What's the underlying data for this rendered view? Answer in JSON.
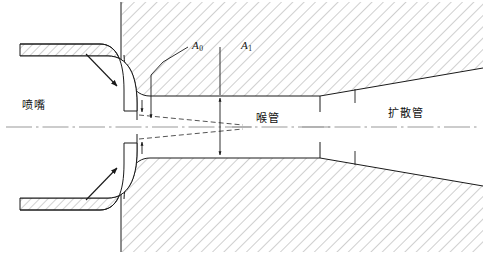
{
  "figure": {
    "kind": "engineering-cross-section",
    "background_color": "#ffffff",
    "line_color": "#1a1a1a",
    "hatch_color": "#8c8c8c",
    "centerline_color": "#999999",
    "dash_color": "#555555"
  },
  "labels": {
    "nozzle": "喷嘴",
    "throat": "喉管",
    "diffuser": "扩散管",
    "area_nozzle": "A",
    "area_nozzle_sub": "0",
    "area_throat": "A",
    "area_throat_sub": "1"
  },
  "annotations": {
    "flow_arrow_top": "suction-flow-arrow-top",
    "flow_arrow_bottom": "suction-flow-arrow-bottom",
    "dimension_throat": "throat-diameter-dimension",
    "leader_nozzle": "nozzle-exit-leader",
    "jet_boundary": "jet-boundary-dashed",
    "centerline": "axis-centerline"
  }
}
